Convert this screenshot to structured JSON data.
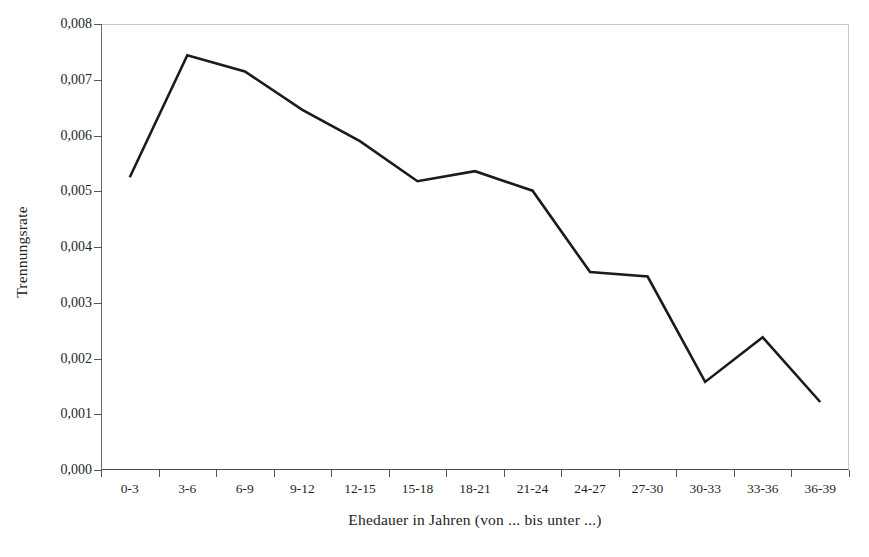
{
  "chart_data": {
    "type": "line",
    "title": "",
    "subtitle": "",
    "xlabel": "Ehedauer in Jahren (von ... bis unter ...)",
    "ylabel": "Trennungsrate",
    "categories": [
      "0-3",
      "3-6",
      "6-9",
      "9-12",
      "12-15",
      "15-18",
      "18-21",
      "21-24",
      "24-27",
      "27-30",
      "30-33",
      "33-36",
      "36-39"
    ],
    "values": [
      0.00525,
      0.00744,
      0.00715,
      0.00646,
      0.0059,
      0.00518,
      0.00536,
      0.00501,
      0.00355,
      0.00347,
      0.00158,
      0.00238,
      0.00122
    ],
    "series": [
      {
        "name": "Trennungsrate",
        "values": [
          0.00525,
          0.00744,
          0.00715,
          0.00646,
          0.0059,
          0.00518,
          0.00536,
          0.00501,
          0.00355,
          0.00347,
          0.00158,
          0.00238,
          0.00122
        ]
      }
    ],
    "ylim": [
      0.0,
      0.008
    ],
    "ytick_values": [
      0.0,
      0.001,
      0.002,
      0.003,
      0.004,
      0.005,
      0.006,
      0.007,
      0.008
    ],
    "ytick_labels": [
      "0,000",
      "0,001",
      "0,002",
      "0,003",
      "0,004",
      "0,005",
      "0,006",
      "0,007",
      "0,008"
    ],
    "grid": false,
    "legend": false,
    "legend_position": "none",
    "line_color": "#1b1b1b",
    "background_color": "#ffffff",
    "axis_color": "#4a4a4a",
    "decimal_separator": ","
  },
  "plot_geometry": {
    "left": 101,
    "top": 24,
    "width": 748,
    "height": 446
  }
}
